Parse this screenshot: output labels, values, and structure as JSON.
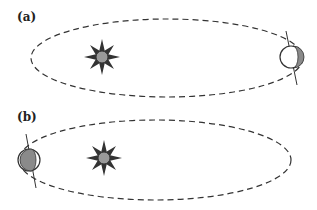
{
  "panels": [
    {
      "label": "(a)",
      "description": "Earth at far right of elliptical orbit, sun near left focus",
      "earth_shaded_side": "right"
    },
    {
      "label": "(b)",
      "description": "Earth at far left of elliptical orbit, sun near left focus",
      "earth_shaded_side": "left"
    }
  ],
  "colors": {
    "orbit": "#333333",
    "sun": "#9a9a9a",
    "sun_rays": "#333333",
    "earth_shade": "#8a8a8a",
    "axis": "#333333"
  },
  "icons": {
    "sun": "sun-icon",
    "earth": "earth-icon"
  }
}
